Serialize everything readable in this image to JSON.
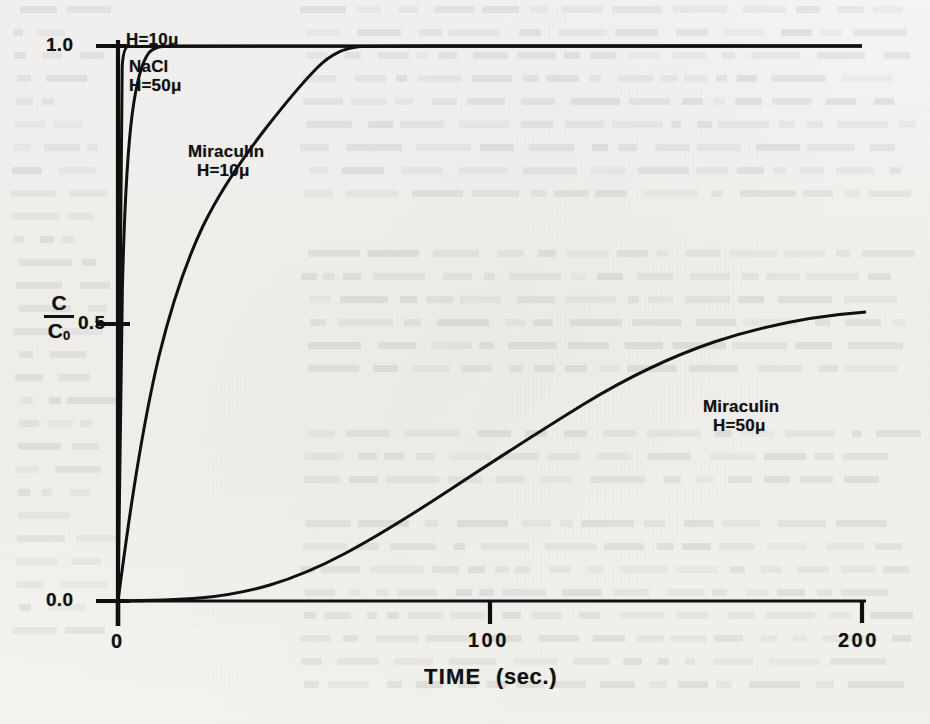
{
  "page": {
    "background_color": "#f5f4f2",
    "ink_color": "#101010",
    "note": "scanned book page with faint show-through text behind the figure"
  },
  "chart_data": {
    "type": "line",
    "title": "",
    "xlabel": "TIME",
    "xunit": "(sec.)",
    "ylabel": "C/C0",
    "ylabel_numerator": "C",
    "ylabel_denominator": "C",
    "ylabel_denominator_sub": "0",
    "xlim": [
      0,
      200
    ],
    "ylim": [
      0.0,
      1.0
    ],
    "xticks": [
      0,
      100,
      200
    ],
    "xtick_labels": [
      "0",
      "100",
      "200"
    ],
    "yticks": [
      0.0,
      0.5,
      1.0
    ],
    "ytick_labels": [
      "0.0",
      "0.5",
      "1.0"
    ],
    "grid": false,
    "legend": "inline curve annotations",
    "series": [
      {
        "name": "H=10u",
        "label_line1": "H=10",
        "label_line2": "",
        "mu": "μ",
        "description": "near-instantaneous step to saturation",
        "x": [
          0,
          0.3,
          0.6,
          0.9,
          1.3,
          1.8,
          2.5,
          4,
          8,
          20,
          60,
          120,
          200
        ],
        "y": [
          0.0,
          0.55,
          0.86,
          0.95,
          0.985,
          0.996,
          0.999,
          1.0,
          1.0,
          1.0,
          1.0,
          1.0,
          1.0
        ]
      },
      {
        "name": "NaCl H=50u",
        "label_line1": "NaCl",
        "label_line2": "H=50",
        "mu": "μ",
        "description": "steep rise reaching saturation by about 6 seconds",
        "x": [
          0,
          0.5,
          1.0,
          1.5,
          2.0,
          2.6,
          3.2,
          4.0,
          5.0,
          6.5,
          9,
          14,
          25,
          60,
          120,
          200
        ],
        "y": [
          0.0,
          0.3,
          0.55,
          0.71,
          0.81,
          0.88,
          0.925,
          0.957,
          0.977,
          0.99,
          0.997,
          1.0,
          1.0,
          1.0,
          1.0,
          1.0
        ]
      },
      {
        "name": "Miraculin H=10u",
        "label_line1": "Miraculin",
        "label_line2": "H=10",
        "mu": "μ",
        "description": "exponential approach to saturation, reaching 1.0 near 50 seconds",
        "x": [
          0,
          1,
          2,
          3,
          4,
          5,
          6.5,
          8,
          10,
          12.5,
          15,
          18,
          21,
          25,
          29,
          33,
          38,
          43,
          48,
          55,
          70,
          100,
          150,
          200
        ],
        "y": [
          0.0,
          0.1,
          0.22,
          0.325,
          0.41,
          0.475,
          0.555,
          0.62,
          0.695,
          0.765,
          0.818,
          0.868,
          0.903,
          0.936,
          0.957,
          0.971,
          0.983,
          0.99,
          0.995,
          0.998,
          1.0,
          1.0,
          1.0,
          1.0
        ]
      },
      {
        "name": "Miraculin H=50u",
        "label_line1": "Miraculin",
        "label_line2": "H=50",
        "mu": "μ",
        "description": "sigmoidal; negligible until about 30 seconds, roughly linear mid-range, reaching about 0.46 at 200 seconds",
        "x": [
          0,
          10,
          20,
          28,
          35,
          45,
          55,
          65,
          80,
          95,
          110,
          125,
          140,
          155,
          170,
          185,
          200
        ],
        "y": [
          0.0,
          0.002,
          0.006,
          0.013,
          0.026,
          0.055,
          0.09,
          0.128,
          0.188,
          0.248,
          0.303,
          0.352,
          0.391,
          0.421,
          0.443,
          0.456,
          0.462
        ]
      }
    ],
    "annotations": [
      {
        "text": "H=10μ",
        "near_x": 3,
        "near_y": 1.0
      },
      {
        "text": "NaCl H=50μ",
        "near_x": 8,
        "near_y": 0.9
      },
      {
        "text": "Miraculin H=10μ",
        "near_x": 22,
        "near_y": 0.72
      },
      {
        "text": "Miraculin H=50μ",
        "near_x": 175,
        "near_y": 0.35
      }
    ]
  },
  "labels": {
    "ytick_1": "1.0",
    "ytick_05": "0.5",
    "ytick_00": "0.0",
    "xtick_0": "0",
    "xtick_100": "100",
    "xtick_200": "200",
    "xaxis_title": "TIME",
    "xaxis_unit": "(sec.)",
    "curve_h10_l1": "H=10μ",
    "curve_nacl_l1": "NaCl",
    "curve_nacl_l2": "H=50μ",
    "curve_mir10_l1": "Miraculin",
    "curve_mir10_l2": "H=10μ",
    "curve_mir50_l1": "Miraculin",
    "curve_mir50_l2": "H=50μ"
  }
}
